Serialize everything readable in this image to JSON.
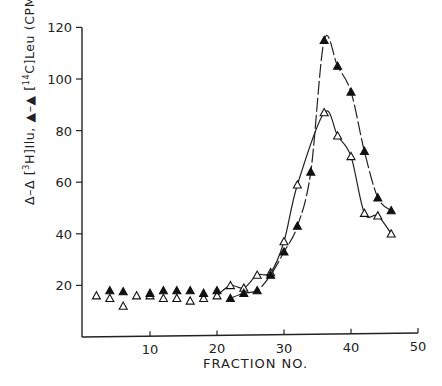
{
  "chart_data": {
    "type": "line",
    "title": "",
    "xlabel": "FRACTION NO.",
    "ylabel": "Δ–Δ [3H]Ilu, ▲–▲ [14C]Leu (CPM)",
    "ylabel_parts": {
      "open_marker": "Δ–Δ",
      "h_bracket_sup": "3",
      "h_name": "H]Ilu,",
      "filled_marker": "▲–▲",
      "c_sup": "14",
      "c_name": "C]Leu",
      "unit": "(CPM)"
    },
    "xlim": [
      0,
      50
    ],
    "ylim": [
      0,
      120
    ],
    "x_ticks": [
      10,
      20,
      30,
      40,
      50
    ],
    "y_ticks": [
      20,
      40,
      60,
      80,
      100,
      120
    ],
    "grid": false,
    "legend": "embedded in y-axis label",
    "series": [
      {
        "name": "[3H]Ilu",
        "marker": "open-triangle",
        "x": [
          2,
          4,
          6,
          8,
          10,
          12,
          14,
          16,
          18,
          20,
          22,
          24,
          26,
          28,
          30,
          32,
          36,
          38,
          40,
          42,
          44,
          46
        ],
        "values": [
          16,
          15,
          12,
          16,
          16,
          15,
          15,
          14,
          15,
          16,
          20,
          19,
          24,
          25,
          37,
          59,
          87,
          78,
          70,
          48,
          47,
          40
        ]
      },
      {
        "name": "[14C]Leu",
        "marker": "filled-triangle",
        "x": [
          4,
          6,
          10,
          12,
          14,
          16,
          18,
          20,
          22,
          24,
          26,
          28,
          30,
          32,
          34,
          36,
          38,
          40,
          42,
          44,
          46
        ],
        "values": [
          18,
          17.6,
          17,
          18,
          18,
          18,
          17,
          18,
          15,
          17,
          18,
          24,
          33,
          43,
          64,
          115,
          105,
          95,
          72,
          54,
          49
        ]
      }
    ],
    "curves": {
      "open_fit_from": 20,
      "filled_fit_from": 22
    }
  },
  "axes": {
    "x_tick_labels": [
      "10",
      "20",
      "30",
      "40",
      "50"
    ],
    "y_tick_labels": [
      "20",
      "40",
      "60",
      "80",
      "100",
      "120"
    ]
  }
}
